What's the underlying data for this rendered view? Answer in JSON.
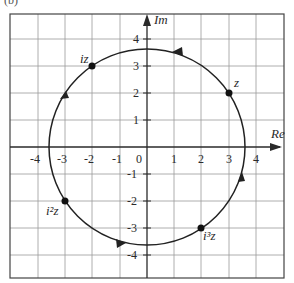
{
  "figure": {
    "partial_label": "(b)",
    "axes": {
      "x_label": "Re",
      "y_label": "Im",
      "origin_label": "0",
      "x_ticks": [
        "-4",
        "-3",
        "-2",
        "-1",
        "1",
        "2",
        "3",
        "4"
      ],
      "y_ticks": [
        "4",
        "3",
        "2",
        "1",
        "-1",
        "-2",
        "-3",
        "-4"
      ]
    },
    "circle": {
      "radius": 3.6,
      "direction": "counterclockwise"
    },
    "points": [
      {
        "label": "z",
        "x": 3,
        "y": 2
      },
      {
        "label": "iz",
        "x": -2,
        "y": 3
      },
      {
        "label": "i²z",
        "x": -3,
        "y": -2
      },
      {
        "label": "i³z",
        "x": 2,
        "y": -3
      }
    ],
    "colors": {
      "grid": "#9a9a9a",
      "axis": "#2a2a2a",
      "curve": "#222222",
      "frame": "#444444"
    }
  }
}
